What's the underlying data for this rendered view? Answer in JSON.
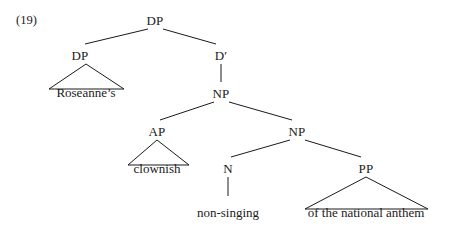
{
  "figure": {
    "example_number": "(19)",
    "type": "syntax-tree",
    "line_color": "#1a1a1a",
    "text_color": "#1a1a1a",
    "background_color": "#ffffff"
  },
  "nodes": [
    {
      "id": "dp-root",
      "label": "DP",
      "x": 155,
      "y": 14
    },
    {
      "id": "dp-spec",
      "label": "DP",
      "x": 80,
      "y": 49
    },
    {
      "id": "d-bar",
      "label": "D′",
      "x": 221,
      "y": 49
    },
    {
      "id": "np-upper",
      "label": "NP",
      "x": 221,
      "y": 87
    },
    {
      "id": "ap",
      "label": "AP",
      "x": 157,
      "y": 125
    },
    {
      "id": "np-lower",
      "label": "NP",
      "x": 297,
      "y": 125
    },
    {
      "id": "n-head",
      "label": "N",
      "x": 228,
      "y": 162
    },
    {
      "id": "pp",
      "label": "PP",
      "x": 366,
      "y": 162
    }
  ],
  "terminals": [
    {
      "id": "roseannes",
      "label": "Roseanne’s",
      "x": 86,
      "y": 86
    },
    {
      "id": "clownish",
      "label": "clownish",
      "x": 157,
      "y": 162
    },
    {
      "id": "non-singing",
      "label": "non-singing",
      "x": 228,
      "y": 206
    },
    {
      "id": "anthem",
      "label": "of the national anthem",
      "x": 366,
      "y": 206
    }
  ],
  "branches": [
    {
      "id": "dp-root-to-dp-spec",
      "x1": 148,
      "y1": 29,
      "x2": 85,
      "y2": 44
    },
    {
      "id": "dp-root-to-d-bar",
      "x1": 163,
      "y1": 29,
      "x2": 216,
      "y2": 44
    },
    {
      "id": "d-bar-to-np-upper",
      "x1": 221,
      "y1": 64,
      "x2": 221,
      "y2": 82
    },
    {
      "id": "np-upper-to-ap",
      "x1": 214,
      "y1": 102,
      "x2": 160,
      "y2": 120
    },
    {
      "id": "np-upper-to-np-lower",
      "x1": 229,
      "y1": 102,
      "x2": 292,
      "y2": 120
    },
    {
      "id": "np-lower-to-n",
      "x1": 290,
      "y1": 140,
      "x2": 231,
      "y2": 157
    },
    {
      "id": "np-lower-to-pp",
      "x1": 305,
      "y1": 140,
      "x2": 361,
      "y2": 157
    },
    {
      "id": "n-to-non-singing",
      "x1": 228,
      "y1": 177,
      "x2": 228,
      "y2": 196
    }
  ],
  "triangles": [
    {
      "id": "dp-spec-triangle",
      "apex_x": 86,
      "apex_y": 64,
      "left_x": 49,
      "right_x": 124,
      "base_y": 89
    },
    {
      "id": "ap-triangle",
      "apex_x": 157,
      "apex_y": 140,
      "left_x": 128,
      "right_x": 189,
      "base_y": 165
    },
    {
      "id": "pp-triangle",
      "apex_x": 366,
      "apex_y": 177,
      "left_x": 305,
      "right_x": 428,
      "base_y": 209
    }
  ]
}
